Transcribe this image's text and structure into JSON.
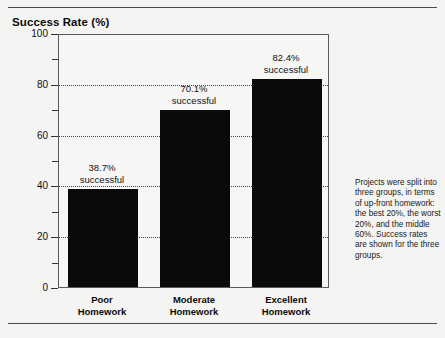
{
  "figure": {
    "title": "Success Rate (%)",
    "note": "Projects were split into three groups, in terms of up-front homework: the best 20%, the worst 20%, and the middle 60%. Success rates are shown for the three groups."
  },
  "axis": {
    "y_ticks": [
      "100",
      "80",
      "60",
      "40",
      "20",
      "0"
    ],
    "y_minor_ticks": [
      90,
      70,
      50,
      30,
      10
    ]
  },
  "bars": [
    {
      "category_line1": "Poor",
      "category_line2": "Homework",
      "value_label": "38.7%",
      "value_suffix": "successful"
    },
    {
      "category_line1": "Moderate",
      "category_line2": "Homework",
      "value_label": "70.1%",
      "value_suffix": "successful"
    },
    {
      "category_line1": "Excellent",
      "category_line2": "Homework",
      "value_label": "82.4%",
      "value_suffix": "successful"
    }
  ],
  "chart_data": {
    "type": "bar",
    "title": "Success Rate (%)",
    "xlabel": "",
    "ylabel": "Success Rate (%)",
    "categories": [
      "Poor Homework",
      "Moderate Homework",
      "Excellent Homework"
    ],
    "values": [
      38.7,
      70.1,
      82.4
    ],
    "data_labels": [
      "38.7% successful",
      "70.1% successful",
      "82.4% successful"
    ],
    "ylim": [
      0,
      100
    ],
    "y_ticks": [
      0,
      20,
      40,
      60,
      80,
      100
    ],
    "y_minor_ticks": [
      10,
      30,
      50,
      70,
      90
    ],
    "gridlines": {
      "horizontal": true,
      "vertical": false,
      "style": "dotted",
      "at": [
        20,
        40,
        60,
        80
      ]
    },
    "legend": null,
    "bar_color": "#0a0a0a",
    "background_color": "#f6f6f4",
    "annotation": "Projects were split into three groups, in terms of up-front homework: the best 20%, the worst 20%, and the middle 60%. Success rates are shown for the three groups."
  }
}
